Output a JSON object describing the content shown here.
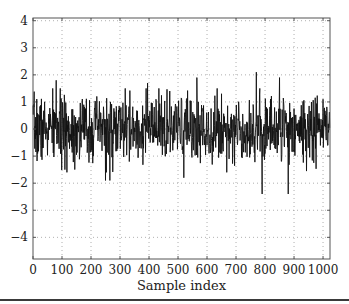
{
  "chart_data": {
    "type": "line",
    "title": "",
    "xlabel": "Sample index",
    "ylabel": "",
    "xlim": [
      0,
      1024
    ],
    "ylim": [
      -4.8,
      4.1
    ],
    "x_ticks": [
      0,
      100,
      200,
      300,
      400,
      500,
      600,
      700,
      800,
      900,
      1000
    ],
    "x_tick_labels": [
      "0",
      "100",
      "200",
      "300",
      "400",
      "500",
      "600",
      "700",
      "800",
      "900",
      "1000"
    ],
    "y_ticks": [
      4,
      3,
      2,
      1,
      0,
      -1,
      -2,
      -3,
      -4
    ],
    "y_tick_labels": [
      "4",
      "3",
      "2",
      "1",
      "0",
      "−1",
      "−2",
      "−3",
      "−4"
    ],
    "grid": true,
    "grid_style": "dotted",
    "legend": null,
    "series": [
      {
        "name": "signal",
        "color": "#111111",
        "n_samples": 1024,
        "description": "zero-mean noise, std ~0.6, mostly within [-1.5, 1.5]",
        "std": 0.6,
        "seed": 7,
        "notable_points": [
          {
            "x": 80,
            "y": 1.8
          },
          {
            "x": 110,
            "y": -1.5
          },
          {
            "x": 250,
            "y": -1.9
          },
          {
            "x": 265,
            "y": -1.9
          },
          {
            "x": 395,
            "y": 1.7
          },
          {
            "x": 520,
            "y": -1.8
          },
          {
            "x": 565,
            "y": 1.9
          },
          {
            "x": 770,
            "y": 2.1
          },
          {
            "x": 790,
            "y": -2.4
          },
          {
            "x": 850,
            "y": 1.9
          },
          {
            "x": 880,
            "y": -2.4
          },
          {
            "x": 1000,
            "y": 1.1
          }
        ]
      }
    ]
  },
  "colors": {
    "line": "#111111",
    "grid": "#9a9a9a",
    "axes": "#555555",
    "background": "#ffffff"
  }
}
